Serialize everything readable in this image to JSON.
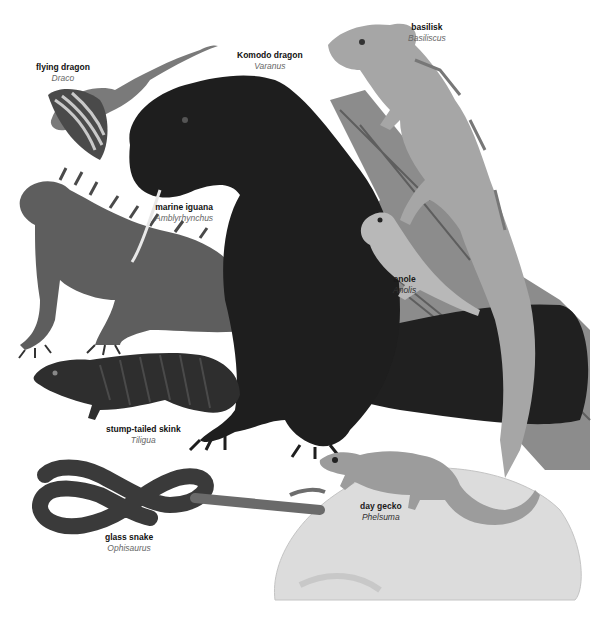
{
  "image": {
    "description": "Illustrated plate of lizard species, grayscale",
    "background": "#ffffff"
  },
  "labels": [
    {
      "id": "flying-dragon",
      "common": "flying dragon",
      "genus": "Draco",
      "x": 36,
      "y": 62
    },
    {
      "id": "komodo-dragon",
      "common": "Komodo dragon",
      "genus": "Varanus",
      "x": 237,
      "y": 50
    },
    {
      "id": "basilisk",
      "common": "basilisk",
      "genus": "Basiliscus",
      "x": 408,
      "y": 22
    },
    {
      "id": "marine-iguana",
      "common": "marine iguana",
      "genus": "Amblyrhynchus",
      "x": 155,
      "y": 202
    },
    {
      "id": "anole",
      "common": "anole",
      "genus": "Anolis",
      "x": 398,
      "y": 274
    },
    {
      "id": "stump-tailed-skink",
      "common": "stump-tailed skink",
      "genus": "Tiligua",
      "x": 106,
      "y": 424
    },
    {
      "id": "glass-snake",
      "common": "glass snake",
      "genus": "Ophisaurus",
      "x": 105,
      "y": 532
    },
    {
      "id": "day-gecko",
      "common": "day gecko",
      "genus": "Phelsuma",
      "x": 363,
      "y": 501
    }
  ],
  "colors": {
    "komodo": "#1c1c1c",
    "iguana": "#5a5a5a",
    "skink": "#2e2e2e",
    "glass_snake": "#3a3a3a",
    "basilisk": "#a8a8a8",
    "branch": "#8a8a8a",
    "rock": "#d9d9d9",
    "gecko": "#9a9a9a",
    "anole": "#b5b5b5",
    "draco_wing": "#4a4a4a"
  }
}
